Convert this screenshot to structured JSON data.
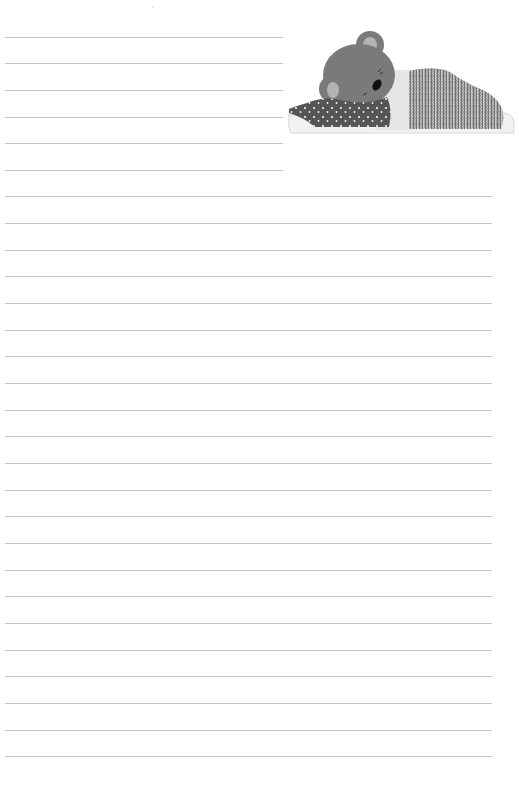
{
  "page": {
    "type": "lined-writing-paper",
    "background_color": "#ffffff",
    "rule_color": "#c4c4c4"
  },
  "rules": {
    "short_lines_y": [
      37,
      63,
      90,
      117,
      143,
      170
    ],
    "full_lines_y": [
      196,
      223,
      250,
      276,
      303,
      330,
      356,
      383,
      410,
      436,
      463,
      490,
      516,
      543,
      570,
      596,
      623,
      650,
      676,
      703,
      730,
      756
    ]
  },
  "illustration": {
    "subject": "sleeping-bear-under-blanket",
    "bear_color": "#7a7a7a",
    "ear_inner_color": "#b0b0b0",
    "pajama_color": "#555555",
    "blanket_pattern": "chevron",
    "blanket_color": "#8a8a8a",
    "pillow_color": "#ececec"
  }
}
